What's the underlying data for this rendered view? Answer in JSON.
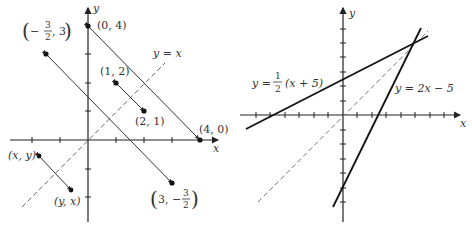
{
  "left_diagram": {
    "x_axis_label": "x",
    "y_axis_label": "y",
    "line_label": "y = x",
    "points": [
      {
        "label": "(0, 4)",
        "x": 0,
        "y": 4
      },
      {
        "label": "(4, 0)",
        "x": 4,
        "y": 0
      },
      {
        "label": "(1, 2)",
        "x": 1,
        "y": 2
      },
      {
        "label": "(2, 1)",
        "x": 2,
        "y": 1
      },
      {
        "label_parts": [
          "−",
          "3",
          "2",
          ", 3"
        ],
        "x": -1.5,
        "y": 3
      },
      {
        "label_parts": [
          "3, −",
          "3",
          "2"
        ],
        "x": 3,
        "y": -1.5
      },
      {
        "label": "(x, y)"
      },
      {
        "label": "(y, x)"
      }
    ]
  },
  "right_diagram": {
    "x_axis_label": "x",
    "y_axis_label": "y",
    "line1_label_prefix": "y = ",
    "line1_frac_num": "1",
    "line1_frac_den": "2",
    "line1_label_suffix": "(x + 5)",
    "line2_label": "y = 2x − 5"
  }
}
